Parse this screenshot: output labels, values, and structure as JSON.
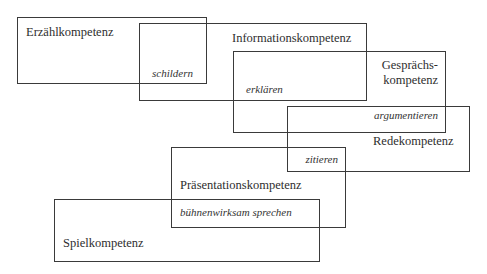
{
  "diagram": {
    "competences": [
      {
        "id": "erzaehl",
        "label": "Erzählkompetenz"
      },
      {
        "id": "information",
        "label": "Informationskompetenz"
      },
      {
        "id": "gespraech",
        "label_line1": "Gesprächs-",
        "label_line2": "kompetenz"
      },
      {
        "id": "rede",
        "label": "Redekompetenz"
      },
      {
        "id": "praesentation",
        "label": "Präsentationskompetenz"
      },
      {
        "id": "spiel",
        "label": "Spielkompetenz"
      }
    ],
    "overlaps": [
      {
        "between": [
          "erzaehl",
          "information"
        ],
        "label": "schildern"
      },
      {
        "between": [
          "information",
          "gespraech"
        ],
        "label": "erklären"
      },
      {
        "between": [
          "gespraech",
          "rede"
        ],
        "label": "argumentieren"
      },
      {
        "between": [
          "rede",
          "praesentation"
        ],
        "label": "zitieren"
      },
      {
        "between": [
          "praesentation",
          "spiel"
        ],
        "label": "bühnenwirksam sprechen"
      }
    ]
  }
}
